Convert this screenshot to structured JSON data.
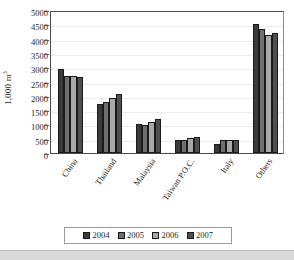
{
  "chart_data": {
    "type": "bar",
    "title": "",
    "xlabel": "",
    "ylabel": "1,000 m³",
    "ylabel_base": "1,000 m",
    "ylabel_exponent": "3",
    "ylim": [
      0,
      5000
    ],
    "ytick_step": 500,
    "ytick_labels": [
      "5000",
      "4500",
      "4000",
      "3500",
      "3000",
      "2500",
      "2000",
      "1500",
      "1000",
      "500",
      "0"
    ],
    "grid": true,
    "grid_axis": "y",
    "legend_position": "bottom-center",
    "categories": [
      "China",
      "Thailand",
      "Malaysia",
      "Taiwan P.O.C.",
      "Italy",
      "Others"
    ],
    "series": [
      {
        "name": "2004",
        "color": "#3a3a3a",
        "values": [
          2950,
          1700,
          1000,
          450,
          300,
          4500
        ]
      },
      {
        "name": "2005",
        "color": "#6e6e6e",
        "values": [
          2700,
          1790,
          970,
          460,
          450,
          4330
        ]
      },
      {
        "name": "2006",
        "color": "#a8a8a8",
        "values": [
          2700,
          1940,
          1080,
          520,
          450,
          4120
        ]
      },
      {
        "name": "2007",
        "color": "#4f4f4f",
        "values": [
          2650,
          2080,
          1200,
          570,
          450,
          4200
        ]
      }
    ]
  },
  "legend": {
    "entries": [
      {
        "label": "2004",
        "color": "#3a3a3a"
      },
      {
        "label": "2005",
        "color": "#6e6e6e"
      },
      {
        "label": "2006",
        "color": "#a8a8a8"
      },
      {
        "label": "2007",
        "color": "#4f4f4f"
      }
    ]
  },
  "colors": {
    "series_2004": "#3a3a3a",
    "series_2005": "#6e6e6e",
    "series_2006": "#a8a8a8",
    "series_2007": "#4f4f4f",
    "axis": "#4a4a4a",
    "gridline": "#ececec",
    "background": "#ffffff",
    "bottom_band": "#d9d9d9"
  }
}
